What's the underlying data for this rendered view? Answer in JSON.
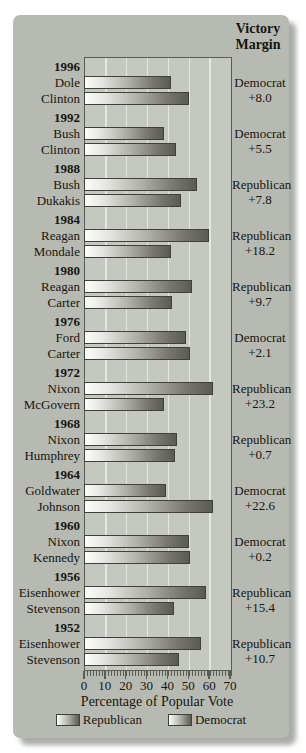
{
  "header": {
    "line1": "Victory",
    "line2": "Margin"
  },
  "colors": {
    "panel": "#b7bab2",
    "plot_background": "#c5c8c0",
    "gridline": "#e4e6e0",
    "frame_border": "#5a5d53",
    "bar_gradient_start": "#fcfcfa",
    "bar_gradient_end": "#5b5b55",
    "text": "#17150e"
  },
  "chart_data": {
    "type": "bar",
    "orientation": "horizontal",
    "title": "",
    "xlabel": "Percentage of Popular Vote",
    "ylabel": "",
    "xlim": [
      0,
      70
    ],
    "x_ticks": [
      0,
      10,
      20,
      30,
      40,
      50,
      60,
      70
    ],
    "grid": "vertical-white-lines-every-10",
    "legend_position": "bottom-center",
    "legend": [
      {
        "label": "Republican"
      },
      {
        "label": "Democrat"
      }
    ],
    "victory_margin_column_header": "Victory Margin",
    "groups": [
      {
        "year": "1996",
        "bars": [
          {
            "name": "Dole",
            "party": "Republican",
            "value": 40.7
          },
          {
            "name": "Clinton",
            "party": "Democrat",
            "value": 49.2
          }
        ],
        "winner_party": "Democrat",
        "margin": "+8.0"
      },
      {
        "year": "1992",
        "bars": [
          {
            "name": "Bush",
            "party": "Republican",
            "value": 37.4
          },
          {
            "name": "Clinton",
            "party": "Democrat",
            "value": 43.0
          }
        ],
        "winner_party": "Democrat",
        "margin": "+5.5"
      },
      {
        "year": "1988",
        "bars": [
          {
            "name": "Bush",
            "party": "Republican",
            "value": 53.4
          },
          {
            "name": "Dukakis",
            "party": "Democrat",
            "value": 45.6
          }
        ],
        "winner_party": "Republican",
        "margin": "+7.8"
      },
      {
        "year": "1984",
        "bars": [
          {
            "name": "Reagan",
            "party": "Republican",
            "value": 58.8
          },
          {
            "name": "Mondale",
            "party": "Democrat",
            "value": 40.6
          }
        ],
        "winner_party": "Republican",
        "margin": "+18.2"
      },
      {
        "year": "1980",
        "bars": [
          {
            "name": "Reagan",
            "party": "Republican",
            "value": 50.7
          },
          {
            "name": "Carter",
            "party": "Democrat",
            "value": 41.0
          }
        ],
        "winner_party": "Republican",
        "margin": "+9.7"
      },
      {
        "year": "1976",
        "bars": [
          {
            "name": "Ford",
            "party": "Republican",
            "value": 48.0
          },
          {
            "name": "Carter",
            "party": "Democrat",
            "value": 50.1
          }
        ],
        "winner_party": "Democrat",
        "margin": "+2.1"
      },
      {
        "year": "1972",
        "bars": [
          {
            "name": "Nixon",
            "party": "Republican",
            "value": 60.7
          },
          {
            "name": "McGovern",
            "party": "Democrat",
            "value": 37.5
          }
        ],
        "winner_party": "Republican",
        "margin": "+23.2"
      },
      {
        "year": "1968",
        "bars": [
          {
            "name": "Nixon",
            "party": "Republican",
            "value": 43.4
          },
          {
            "name": "Humphrey",
            "party": "Democrat",
            "value": 42.7
          }
        ],
        "winner_party": "Republican",
        "margin": "+0.7"
      },
      {
        "year": "1964",
        "bars": [
          {
            "name": "Goldwater",
            "party": "Republican",
            "value": 38.5
          },
          {
            "name": "Johnson",
            "party": "Democrat",
            "value": 61.1
          }
        ],
        "winner_party": "Democrat",
        "margin": "+22.6"
      },
      {
        "year": "1960",
        "bars": [
          {
            "name": "Nixon",
            "party": "Republican",
            "value": 49.5
          },
          {
            "name": "Kennedy",
            "party": "Democrat",
            "value": 49.7
          }
        ],
        "winner_party": "Democrat",
        "margin": "+0.2"
      },
      {
        "year": "1956",
        "bars": [
          {
            "name": "Eisenhower",
            "party": "Republican",
            "value": 57.4
          },
          {
            "name": "Stevenson",
            "party": "Democrat",
            "value": 42.0
          }
        ],
        "winner_party": "Republican",
        "margin": "+15.4"
      },
      {
        "year": "1952",
        "bars": [
          {
            "name": "Eisenhower",
            "party": "Republican",
            "value": 55.1
          },
          {
            "name": "Stevenson",
            "party": "Democrat",
            "value": 44.4
          }
        ],
        "winner_party": "Republican",
        "margin": "+10.7"
      }
    ]
  }
}
